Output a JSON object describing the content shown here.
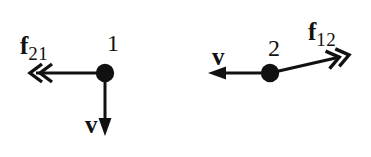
{
  "figure": {
    "type": "physics-force-diagram",
    "background_color": "#ffffff",
    "ink_color": "#111111",
    "width": 371,
    "height": 157
  },
  "particles": [
    {
      "id": "particle-1",
      "label": "1",
      "center": {
        "x": 105,
        "y": 73
      },
      "radius": 9
    },
    {
      "id": "particle-2",
      "label": "2",
      "center": {
        "x": 270,
        "y": 73
      },
      "radius": 9
    }
  ],
  "vectors": [
    {
      "id": "force-f21",
      "symbol": "f",
      "subscript": "21",
      "meaning": "force on particle 1 from particle 2",
      "from": {
        "x": 105,
        "y": 73
      },
      "to": {
        "x": 30,
        "y": 73
      },
      "direction": "left",
      "arrowhead": "double-chevron"
    },
    {
      "id": "velocity-1",
      "symbol": "v",
      "subscript": "",
      "meaning": "velocity of particle 1",
      "from": {
        "x": 105,
        "y": 73
      },
      "to": {
        "x": 105,
        "y": 134
      },
      "direction": "down",
      "arrowhead": "solid-triangle"
    },
    {
      "id": "velocity-2",
      "symbol": "v",
      "subscript": "",
      "meaning": "velocity of particle 2",
      "from": {
        "x": 270,
        "y": 73
      },
      "to": {
        "x": 210,
        "y": 73
      },
      "direction": "left",
      "arrowhead": "solid-triangle"
    },
    {
      "id": "force-f12",
      "symbol": "f",
      "subscript": "12",
      "meaning": "force on particle 2 from particle 1",
      "from": {
        "x": 270,
        "y": 73
      },
      "to": {
        "x": 349,
        "y": 55
      },
      "direction": "up-right",
      "arrowhead": "double-chevron"
    }
  ],
  "labels": {
    "force_f21": {
      "symbol": "f",
      "subscript": "21"
    },
    "force_f12": {
      "symbol": "f",
      "subscript": "12"
    },
    "velocity_1": {
      "symbol": "v"
    },
    "velocity_2": {
      "symbol": "v"
    },
    "particle_1": "1",
    "particle_2": "2"
  }
}
